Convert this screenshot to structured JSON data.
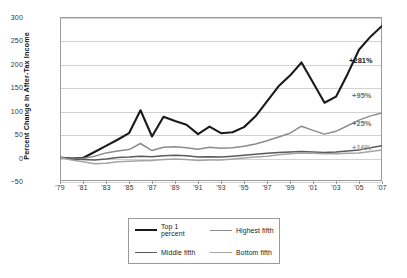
{
  "chart_data": {
    "type": "line",
    "title": "",
    "xlabel": "",
    "ylabel": "Percent Change in After-Tax Income",
    "ylim": [
      -50,
      300
    ],
    "yticks": [
      300,
      250,
      200,
      150,
      100,
      50,
      0,
      -50
    ],
    "ytick_labels": [
      "300",
      "250",
      "200",
      "150",
      "100",
      "50",
      "0",
      "−50"
    ],
    "xlim": [
      1979,
      2007
    ],
    "xticks": [
      1979,
      1981,
      1983,
      1985,
      1987,
      1989,
      1991,
      1993,
      1995,
      1997,
      1999,
      2001,
      2003,
      2005,
      2007
    ],
    "xtick_labels": [
      "'79",
      "'81",
      "'83",
      "'85",
      "'87",
      "'89",
      "'91",
      "'93",
      "'95",
      "'97",
      "'99",
      "'01",
      "'03",
      "'05",
      "'07"
    ],
    "grid": true,
    "legend_position": "bottom",
    "x": [
      1979,
      1980,
      1981,
      1982,
      1983,
      1984,
      1985,
      1986,
      1987,
      1988,
      1989,
      1990,
      1991,
      1992,
      1993,
      1994,
      1995,
      1996,
      1997,
      1998,
      1999,
      2000,
      2001,
      2002,
      2003,
      2004,
      2005,
      2006,
      2007
    ],
    "series": [
      {
        "name": "Top 1 percent",
        "color": "#1a1a1a",
        "width": 2.1,
        "end_label": "+281%",
        "values": [
          0,
          -2,
          -1,
          12,
          25,
          38,
          52,
          101,
          45,
          87,
          78,
          70,
          50,
          66,
          52,
          54,
          65,
          88,
          120,
          152,
          175,
          203,
          160,
          117,
          130,
          178,
          230,
          258,
          281
        ]
      },
      {
        "name": "Highest fifth",
        "color": "#8c8c8c",
        "width": 1.5,
        "end_label": "+95%",
        "values": [
          0,
          -3,
          -2,
          3,
          10,
          14,
          17,
          30,
          15,
          22,
          23,
          21,
          18,
          22,
          20,
          21,
          24,
          29,
          36,
          44,
          52,
          67,
          58,
          50,
          56,
          68,
          80,
          89,
          95
        ]
      },
      {
        "name": "Middle fifth",
        "color": "#5a5a5a",
        "width": 1.5,
        "end_label": "+25%",
        "values": [
          0,
          -3,
          -4,
          -5,
          -3,
          0,
          1,
          3,
          2,
          4,
          5,
          4,
          1,
          2,
          1,
          3,
          5,
          7,
          9,
          11,
          12,
          13,
          12,
          11,
          12,
          14,
          16,
          21,
          25
        ]
      },
      {
        "name": "Bottom fifth",
        "color": "#a5a5a5",
        "width": 1.5,
        "end_label": "+16%",
        "values": [
          0,
          -5,
          -9,
          -13,
          -12,
          -9,
          -8,
          -7,
          -6,
          -4,
          -3,
          -4,
          -6,
          -5,
          -5,
          -3,
          -1,
          1,
          3,
          6,
          8,
          10,
          9,
          8,
          8,
          9,
          10,
          13,
          16
        ]
      }
    ],
    "annotations": [
      {
        "text": "+281%",
        "value": 281,
        "color": "#1a1a1a",
        "left": 349,
        "top": 56
      },
      {
        "text": "+95%",
        "value": 95,
        "color": "#6e6e6e",
        "left": 352,
        "top": 91
      },
      {
        "text": "+25%",
        "value": 25,
        "color": "#6e6e6e",
        "left": 352,
        "top": 119
      },
      {
        "text": "+16%",
        "value": 16,
        "color": "#9a9a9a",
        "left": 352,
        "top": 143
      }
    ]
  },
  "legend": {
    "items": [
      {
        "label": "Top 1 percent",
        "color": "#1a1a1a",
        "width": 2.1
      },
      {
        "label": "Highest fifth",
        "color": "#8c8c8c",
        "width": 1.5
      },
      {
        "label": "Middle fifth",
        "color": "#5a5a5a",
        "width": 1.5
      },
      {
        "label": "Bottom fifth",
        "color": "#a5a5a5",
        "width": 1.5
      }
    ]
  }
}
